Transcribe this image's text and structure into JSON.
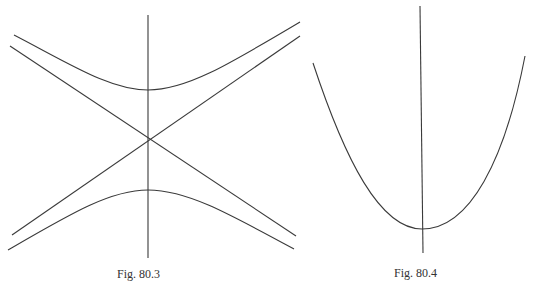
{
  "figures": [
    {
      "id": "hyperbola",
      "caption": "Fig. 80.3",
      "description": "Hyperbola with two branches (opening up and down), vertical axis, and two crossing asymptotes",
      "axis": {
        "x": 148,
        "y1": 15,
        "y2": 258
      },
      "center": [
        148,
        141
      ],
      "upper_vertex": [
        148,
        90
      ],
      "lower_vertex": [
        148,
        190
      ],
      "asymptotes": [
        {
          "from": [
            10,
            65
          ],
          "to": [
            300,
            222
          ]
        },
        {
          "from": [
            12,
            235
          ],
          "to": [
            300,
            28
          ]
        }
      ]
    },
    {
      "id": "parabola",
      "caption": "Fig. 80.4",
      "description": "Upward-opening parabola with vertical axis of symmetry",
      "axis": {
        "x": 420,
        "y1": 6,
        "y2": 253
      },
      "vertex": [
        422,
        229
      ],
      "left_end": [
        313,
        63
      ],
      "right_end": [
        525,
        56
      ]
    }
  ],
  "colors": {
    "line": "#3a3a3a",
    "background": "#ffffff",
    "caption": "#333333"
  }
}
